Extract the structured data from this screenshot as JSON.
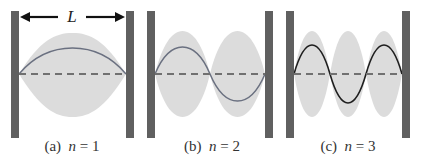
{
  "figure": {
    "length_label": "L",
    "colors": {
      "wall": "#606060",
      "envelope": "#dcdcdc",
      "dashed_axis": "#707070",
      "wave_light": "#6a7080",
      "wave_dark": "#1e1e1e",
      "arrow": "#111111",
      "text": "#333333"
    },
    "panels": [
      {
        "id": "a",
        "letter": "(a)",
        "n_symbol": "n",
        "equals": "=",
        "n_value": "1",
        "caption": "(a)  n = 1"
      },
      {
        "id": "b",
        "letter": "(b)",
        "n_symbol": "n",
        "equals": "=",
        "n_value": "2",
        "caption": "(b)  n = 2"
      },
      {
        "id": "c",
        "letter": "(c)",
        "n_symbol": "n",
        "equals": "=",
        "n_value": "3",
        "caption": "(c)  n = 3"
      }
    ]
  }
}
